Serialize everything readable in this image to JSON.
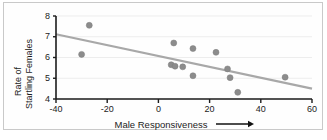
{
  "chart_data": {
    "type": "scatter",
    "title": "",
    "xlabel": "Male Responsiveness",
    "ylabel": "Rate of Startling Females",
    "ylabel_line1": "Rate of",
    "ylabel_line2": "Startling Females",
    "xlabel_has_arrow": true,
    "xlim": [
      -40,
      60
    ],
    "ylim": [
      4,
      8
    ],
    "xticks": [
      -40,
      -20,
      0,
      20,
      40,
      60
    ],
    "xtick_labels": [
      "-40",
      "-20",
      "0",
      "20",
      "40",
      "60"
    ],
    "yticks": [
      4,
      5,
      6,
      7,
      8
    ],
    "ytick_labels": [
      "4",
      "5",
      "6",
      "7",
      "8"
    ],
    "grid": "horizontal-faint",
    "legend": "none",
    "marker_color": "#8c8c8c",
    "trendline_color": "#a8a8a8",
    "axis_color": "#1c1c1c",
    "points": [
      {
        "x": -27.0,
        "y": 7.55
      },
      {
        "x": -30.0,
        "y": 6.15
      },
      {
        "x": 6.0,
        "y": 6.7
      },
      {
        "x": 13.5,
        "y": 6.43
      },
      {
        "x": 22.5,
        "y": 6.25
      },
      {
        "x": 5.0,
        "y": 5.65
      },
      {
        "x": 6.5,
        "y": 5.58
      },
      {
        "x": 9.5,
        "y": 5.55
      },
      {
        "x": 27.0,
        "y": 5.45
      },
      {
        "x": 13.5,
        "y": 5.12
      },
      {
        "x": 28.0,
        "y": 5.03
      },
      {
        "x": 49.5,
        "y": 5.05
      },
      {
        "x": 31.0,
        "y": 4.32
      }
    ],
    "trendline": {
      "x_start": -40,
      "y_start": 7.12,
      "x_end": 60,
      "y_end": 4.5
    }
  }
}
